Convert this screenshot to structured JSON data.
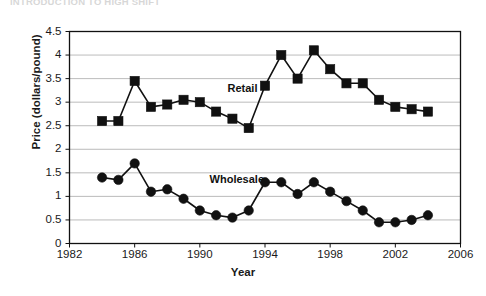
{
  "caption": {
    "text": "INTRODUCTION TO HIGH SHIFT"
  },
  "chart_data": {
    "type": "line",
    "title": "",
    "xlabel": "Year",
    "ylabel": "Price (dollars/pound)",
    "xlim": [
      1982,
      2006
    ],
    "ylim": [
      0,
      4.5
    ],
    "grid": true,
    "legend_position": "inline-annotation",
    "xticks": [
      1982,
      1986,
      1990,
      1994,
      1998,
      2002,
      2006
    ],
    "yticks": [
      0,
      0.5,
      1,
      1.5,
      2,
      2.5,
      3,
      3.5,
      4,
      4.5
    ],
    "x": [
      1984,
      1985,
      1986,
      1987,
      1988,
      1989,
      1990,
      1991,
      1992,
      1993,
      1994,
      1995,
      1996,
      1997,
      1998,
      1999,
      2000,
      2001,
      2002,
      2003,
      2004
    ],
    "series": [
      {
        "name": "Retail",
        "marker": "square",
        "color": "#111111",
        "values": [
          2.6,
          2.6,
          3.45,
          2.9,
          2.95,
          3.05,
          3.0,
          2.8,
          2.65,
          2.45,
          3.35,
          4.0,
          3.5,
          4.1,
          3.7,
          3.4,
          3.4,
          3.05,
          2.9,
          2.85,
          2.8
        ]
      },
      {
        "name": "Wholesale",
        "marker": "circle",
        "color": "#111111",
        "values": [
          1.4,
          1.35,
          1.7,
          1.1,
          1.15,
          0.95,
          0.7,
          0.6,
          0.55,
          0.7,
          1.3,
          1.3,
          1.05,
          1.3,
          1.1,
          0.9,
          0.7,
          0.45,
          0.45,
          0.5,
          0.6
        ]
      }
    ],
    "annotations": [
      {
        "text": "Retail",
        "x": 1991.7,
        "y": 3.28
      },
      {
        "text": "Wholesale",
        "x": 1990.6,
        "y": 1.34
      }
    ]
  }
}
